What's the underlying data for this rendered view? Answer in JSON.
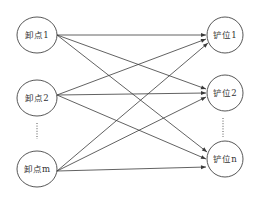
{
  "diagram": {
    "type": "bipartite-directed-graph",
    "colors": {
      "stroke": "#3a3a3a",
      "background": "#ffffff",
      "text": "#333333"
    },
    "left_nodes": [
      {
        "id": "L1",
        "label": "卸点1",
        "cx": 37,
        "cy": 35
      },
      {
        "id": "L2",
        "label": "卸点2",
        "cx": 37,
        "cy": 98
      },
      {
        "id": "Lm",
        "label": "卸点m",
        "cx": 37,
        "cy": 169
      }
    ],
    "right_nodes": [
      {
        "id": "R1",
        "label": "铲位1",
        "cx": 225,
        "cy": 35
      },
      {
        "id": "R2",
        "label": "铲位2",
        "cx": 225,
        "cy": 93
      },
      {
        "id": "Rn",
        "label": "铲位n",
        "cx": 225,
        "cy": 159
      }
    ],
    "left_ellipsis": "⋮",
    "right_ellipsis": "⋮",
    "edges": [
      {
        "from": "L1",
        "to": "R1"
      },
      {
        "from": "L1",
        "to": "R2"
      },
      {
        "from": "L1",
        "to": "Rn"
      },
      {
        "from": "L2",
        "to": "R1"
      },
      {
        "from": "L2",
        "to": "R2"
      },
      {
        "from": "L2",
        "to": "Rn"
      },
      {
        "from": "Lm",
        "to": "R1"
      },
      {
        "from": "Lm",
        "to": "R2"
      },
      {
        "from": "Lm",
        "to": "Rn"
      }
    ]
  }
}
